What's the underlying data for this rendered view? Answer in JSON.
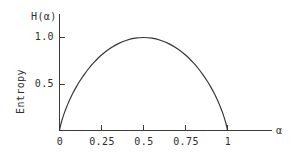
{
  "figure": {
    "background_color": "#ffffff",
    "ink_color": "#333333"
  },
  "chart_data": {
    "type": "line",
    "title": "",
    "subtitle": "",
    "xlabel": "α",
    "ylabel": "Entropy",
    "y_axis_top_label": "H(α)",
    "xlim": [
      0,
      1.18
    ],
    "ylim": [
      0,
      1.12
    ],
    "xticks": [
      0,
      0.25,
      0.5,
      0.75,
      1
    ],
    "xticklabels": [
      "0",
      "0.25",
      "0.5",
      "0.75",
      "1"
    ],
    "yticks": [
      0.5,
      1.0
    ],
    "yticklabels": [
      "0.5",
      "1.0"
    ],
    "grid": false,
    "legend": null,
    "annotations": [],
    "series": [
      {
        "name": "H(α) = -α log2 α - (1-α) log2 (1-α)",
        "color": "#333333",
        "x": [
          0,
          0.005,
          0.01,
          0.02,
          0.03,
          0.04,
          0.05,
          0.06,
          0.08,
          0.1,
          0.12,
          0.15,
          0.18,
          0.2,
          0.25,
          0.3,
          0.35,
          0.4,
          0.45,
          0.5,
          0.55,
          0.6,
          0.65,
          0.7,
          0.75,
          0.8,
          0.82,
          0.85,
          0.88,
          0.9,
          0.92,
          0.94,
          0.95,
          0.96,
          0.97,
          0.98,
          0.99,
          0.995,
          1
        ],
        "y": [
          0,
          0.0454,
          0.0808,
          0.1414,
          0.1944,
          0.2423,
          0.2864,
          0.3274,
          0.4022,
          0.469,
          0.5294,
          0.6098,
          0.6801,
          0.7219,
          0.8113,
          0.8813,
          0.9341,
          0.971,
          0.9928,
          1.0,
          0.9928,
          0.971,
          0.9341,
          0.8813,
          0.8113,
          0.7219,
          0.6801,
          0.6098,
          0.5294,
          0.469,
          0.4022,
          0.3274,
          0.2864,
          0.2423,
          0.1944,
          0.1414,
          0.0808,
          0.0454,
          0
        ]
      }
    ]
  },
  "labels": {
    "y_top": "H(α)",
    "y_axis_name": "Entropy",
    "x_right": "α",
    "ytick_1": "1.0",
    "ytick_0_5": "0.5",
    "xtick_0": "0",
    "xtick_0_25": "0.25",
    "xtick_0_5": "0.5",
    "xtick_0_75": "0.75",
    "xtick_1": "1"
  }
}
